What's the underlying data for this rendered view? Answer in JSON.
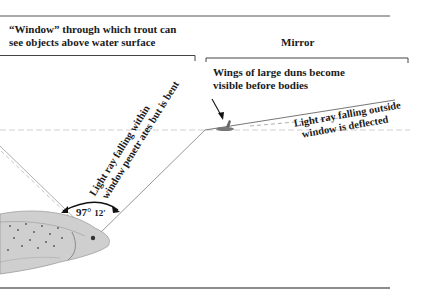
{
  "diagram": {
    "window_label_line1": "“Window” through which trout can",
    "window_label_line2": "see objects above water surface",
    "mirror_label": "Mirror",
    "duns_label_line1": "Wings of large duns become",
    "duns_label_line2": "visible before bodies",
    "ray_inside_line1": "Light ray falling  within",
    "ray_inside_line2": "window penetr ates but is bent",
    "ray_outside_line1": "Light ray falling outside",
    "ray_outside_line2": "window is deflected",
    "angle_degrees": "97°",
    "angle_minutes": "12′"
  },
  "colors": {
    "text": "#1a1a1a",
    "rule": "#555555",
    "ray": "#8a8a8a",
    "water": "#c8c8c8"
  }
}
